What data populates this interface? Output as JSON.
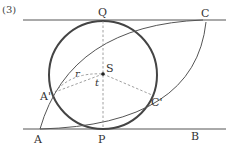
{
  "problem_number": "(3)",
  "points": {
    "Q": "Q",
    "C": "C",
    "S": "S",
    "A_prime": "A'",
    "C_prime": "C'",
    "A": "A",
    "P": "P",
    "B": "B"
  },
  "segment_labels": {
    "r": "r",
    "t": "t"
  },
  "colors": {
    "line": "#555555",
    "circle": "#444444",
    "dashed": "#888888"
  }
}
